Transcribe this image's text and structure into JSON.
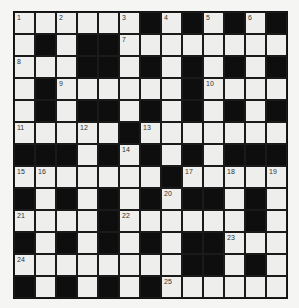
{
  "puzzle": {
    "rows": 13,
    "cols": 13,
    "colors": {
      "white_cell": "#eeeeec",
      "black_cell": "#0e0e0e",
      "border": "#111111",
      "background": "#f5f5f3"
    },
    "grid": [
      "WWWWWWBWBWBWB",
      "WBWBBWWWWWWWW",
      "WWWBBWBWBWBWB",
      "WBWWWWWWBWWWW",
      "WBWBBWBWBWBWB",
      "WWWWWBWWWWWWW",
      "BBBWBWBWBWBBB",
      "WWWWWWWBWWWWW",
      "BWBWBWBWBBWBW",
      "WWWWBWWWWWWBW",
      "BWBWBWBWBBWWW",
      "WWWWWWWWBBWBW",
      "BWBWBWBWWWWWW"
    ],
    "numbers": [
      {
        "r": 0,
        "c": 0,
        "n": "1"
      },
      {
        "r": 0,
        "c": 2,
        "n": "2"
      },
      {
        "r": 0,
        "c": 5,
        "n": "3"
      },
      {
        "r": 0,
        "c": 7,
        "n": "4"
      },
      {
        "r": 0,
        "c": 9,
        "n": "5"
      },
      {
        "r": 0,
        "c": 11,
        "n": "6"
      },
      {
        "r": 1,
        "c": 5,
        "n": "7"
      },
      {
        "r": 2,
        "c": 0,
        "n": "8"
      },
      {
        "r": 3,
        "c": 2,
        "n": "9"
      },
      {
        "r": 3,
        "c": 9,
        "n": "10"
      },
      {
        "r": 5,
        "c": 0,
        "n": "11"
      },
      {
        "r": 5,
        "c": 3,
        "n": "12"
      },
      {
        "r": 5,
        "c": 6,
        "n": "13"
      },
      {
        "r": 6,
        "c": 5,
        "n": "14"
      },
      {
        "r": 7,
        "c": 0,
        "n": "15"
      },
      {
        "r": 7,
        "c": 1,
        "n": "16"
      },
      {
        "r": 7,
        "c": 8,
        "n": "17"
      },
      {
        "r": 7,
        "c": 10,
        "n": "18"
      },
      {
        "r": 7,
        "c": 12,
        "n": "19"
      },
      {
        "r": 8,
        "c": 7,
        "n": "20"
      },
      {
        "r": 9,
        "c": 0,
        "n": "21"
      },
      {
        "r": 9,
        "c": 5,
        "n": "22"
      },
      {
        "r": 10,
        "c": 10,
        "n": "23"
      },
      {
        "r": 11,
        "c": 0,
        "n": "24"
      },
      {
        "r": 12,
        "c": 7,
        "n": "25"
      }
    ]
  }
}
